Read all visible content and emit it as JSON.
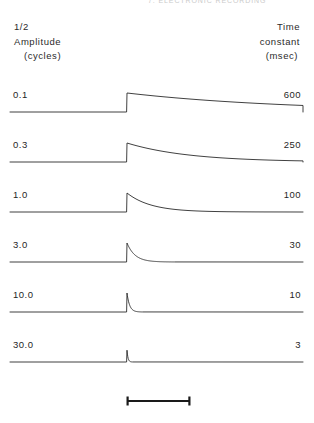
{
  "running_head": "7. ELECTRONIC RECORDING",
  "headers": {
    "left": [
      "1/2",
      "Amplitude",
      "(cycles)"
    ],
    "right": [
      "Time",
      "constant",
      "(msec)"
    ]
  },
  "rows": [
    {
      "amplitude": "0.1",
      "time_constant": "600"
    },
    {
      "amplitude": "0.3",
      "time_constant": "250"
    },
    {
      "amplitude": "1.0",
      "time_constant": "100"
    },
    {
      "amplitude": "3.0",
      "time_constant": "30"
    },
    {
      "amplitude": "10.0",
      "time_constant": "10"
    },
    {
      "amplitude": "30.0",
      "time_constant": "3"
    }
  ],
  "scale_bar": {
    "label": ""
  },
  "colors": {
    "ink": "#1a1a1a",
    "trace": "#2b2b2b",
    "background": "#ffffff"
  },
  "chart_data": {
    "type": "line",
    "title": "",
    "xlabel": "",
    "ylabel": "",
    "series": [
      {
        "name": "600 msec",
        "half_amplitude_cycles": 0.1,
        "time_constant_msec": 600,
        "decay_px": 165,
        "peak": 1.0
      },
      {
        "name": "250 msec",
        "half_amplitude_cycles": 0.3,
        "time_constant_msec": 250,
        "decay_px": 62,
        "peak": 1.0
      },
      {
        "name": "100 msec",
        "half_amplitude_cycles": 1.0,
        "time_constant_msec": 100,
        "decay_px": 24,
        "peak": 1.0
      },
      {
        "name": "30 msec",
        "half_amplitude_cycles": 3.0,
        "time_constant_msec": 30,
        "decay_px": 8,
        "peak": 1.0
      },
      {
        "name": "10 msec",
        "half_amplitude_cycles": 10.0,
        "time_constant_msec": 10,
        "decay_px": 2.6,
        "peak": 1.0
      },
      {
        "name": "3 msec",
        "half_amplitude_cycles": 30.0,
        "time_constant_msec": 3,
        "decay_px": 1.0,
        "peak": 0.62
      }
    ],
    "x": {
      "onset_px": 127,
      "baseline_start_px": 10,
      "baseline_end_px": 303
    },
    "legend": "none",
    "grid": false
  }
}
